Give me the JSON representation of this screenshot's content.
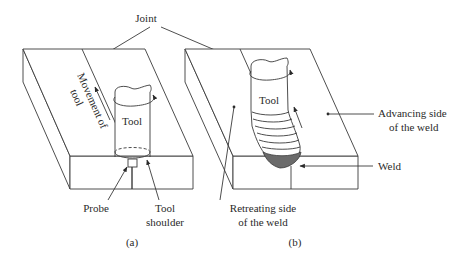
{
  "figure": {
    "type": "friction stir welding schematic",
    "panels": [
      {
        "id": "a",
        "caption": "(a)",
        "labels": {
          "tool": "Tool",
          "movement_line1": "Movement of",
          "movement_line2": "tool",
          "probe": "Probe",
          "shoulder_line1": "Tool",
          "shoulder_line2": "shoulder"
        }
      },
      {
        "id": "b",
        "caption": "(b)",
        "labels": {
          "tool": "Tool",
          "advancing_line1": "Advancing side",
          "advancing_line2": "of the weld",
          "retreating_line1": "Retreating side",
          "retreating_line2": "of the weld",
          "weld": "Weld"
        }
      }
    ],
    "shared_labels": {
      "joint": "Joint"
    },
    "colors": {
      "line": "#3a3a3a",
      "weld_fill": "#6b6b6b",
      "background": "#ffffff"
    }
  }
}
